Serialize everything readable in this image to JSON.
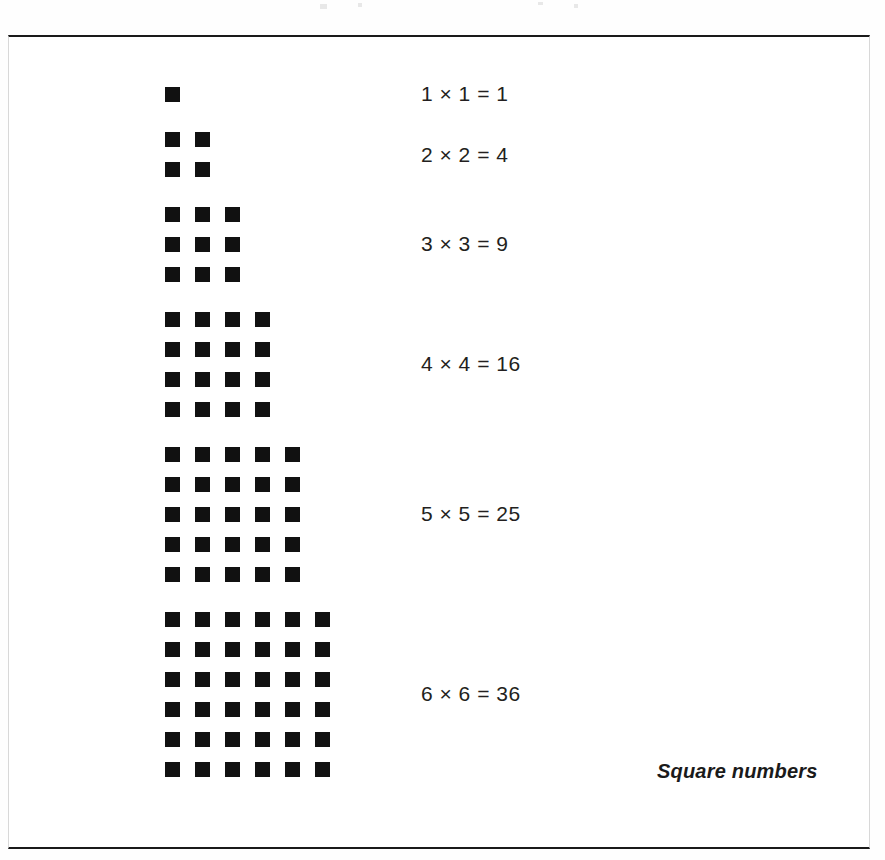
{
  "figure": {
    "caption": "Square numbers",
    "frame": {
      "border_color": "#1a1a1a",
      "background": "#ffffff"
    },
    "dot": {
      "color": "#111111",
      "size_px": 15,
      "gap_px": 15
    },
    "rows": [
      {
        "n": 1,
        "columns": 1,
        "rows": 1,
        "count": 1,
        "equation": "1 × 1 = 1",
        "left_operand": 1,
        "right_operand": 1,
        "product": 1,
        "top_px": 50,
        "equation_center_px": 57
      },
      {
        "n": 2,
        "columns": 2,
        "rows": 2,
        "count": 4,
        "equation": "2 × 2 = 4",
        "left_operand": 2,
        "right_operand": 2,
        "product": 4,
        "top_px": 95,
        "equation_center_px": 118
      },
      {
        "n": 3,
        "columns": 3,
        "rows": 3,
        "count": 9,
        "equation": "3 × 3 = 9",
        "left_operand": 3,
        "right_operand": 3,
        "product": 9,
        "top_px": 170,
        "equation_center_px": 207
      },
      {
        "n": 4,
        "columns": 4,
        "rows": 4,
        "count": 16,
        "equation": "4 × 4 = 16",
        "left_operand": 4,
        "right_operand": 4,
        "product": 16,
        "top_px": 275,
        "equation_center_px": 327
      },
      {
        "n": 5,
        "columns": 5,
        "rows": 5,
        "count": 25,
        "equation": "5 × 5 = 25",
        "left_operand": 5,
        "right_operand": 5,
        "product": 25,
        "top_px": 410,
        "equation_center_px": 477
      },
      {
        "n": 6,
        "columns": 6,
        "rows": 6,
        "count": 36,
        "equation": "6 × 6 = 36",
        "left_operand": 6,
        "right_operand": 6,
        "product": 36,
        "top_px": 575,
        "equation_center_px": 657
      }
    ]
  },
  "chart_data": {
    "type": "bar",
    "title": "Square numbers",
    "xlabel": "n",
    "ylabel": "n × n",
    "categories": [
      "1",
      "2",
      "3",
      "4",
      "5",
      "6"
    ],
    "values": [
      1,
      4,
      9,
      16,
      25,
      36
    ],
    "labels": [
      "1 × 1 = 1",
      "2 × 2 = 4",
      "3 × 3 = 9",
      "4 × 4 = 16",
      "5 × 5 = 25",
      "6 × 6 = 36"
    ],
    "grid": false,
    "legend": "none",
    "note": "Each value n×n is depicted as a square array of n rows by n columns of filled black squares."
  }
}
